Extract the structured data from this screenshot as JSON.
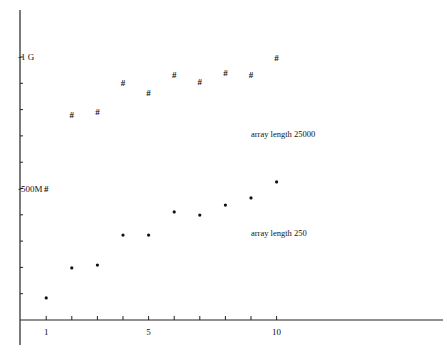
{
  "chart_data": {
    "type": "scatter",
    "title": "",
    "xlabel": "",
    "ylabel": "",
    "xlim": [
      0,
      17
    ],
    "ylim": [
      0,
      1050
    ],
    "y_unit": "M",
    "grid": false,
    "x_ticks": [
      1,
      2,
      3,
      4,
      5,
      6,
      7,
      8,
      9,
      10
    ],
    "x_tick_labels": [
      {
        "value": 1,
        "label": "1"
      },
      {
        "value": 5,
        "label": "5"
      },
      {
        "value": 10,
        "label": "10"
      }
    ],
    "y_ticks": [
      100,
      200,
      300,
      400,
      500,
      600,
      700,
      800,
      900,
      1000
    ],
    "y_tick_labels": [
      {
        "value": 1000,
        "label": "1 G"
      },
      {
        "value": 500,
        "label": "500M"
      }
    ],
    "series": [
      {
        "name": "array length  25000",
        "marker": "#",
        "x": [
          1,
          2,
          3,
          4,
          5,
          6,
          7,
          8,
          9,
          10
        ],
        "values": [
          500,
          780,
          790,
          900,
          865,
          930,
          905,
          940,
          930,
          995
        ]
      },
      {
        "name": "array length  250",
        "marker": "•",
        "x": [
          1,
          2,
          3,
          4,
          5,
          6,
          7,
          8,
          9,
          10
        ],
        "values": [
          84,
          198,
          209,
          323,
          323,
          411,
          399,
          437,
          464,
          525
        ]
      }
    ],
    "annotations": [
      {
        "text": "array length  25000",
        "x": 9,
        "y": 695
      },
      {
        "text": "array length  250",
        "x": 9,
        "y": 320
      }
    ]
  }
}
